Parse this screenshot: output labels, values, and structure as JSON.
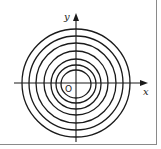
{
  "diagram": {
    "type": "contour-plot",
    "axes": {
      "x_label": "x",
      "y_label": "y",
      "origin_label": "O"
    },
    "center": [
      76,
      83
    ],
    "contours": [
      {
        "rx": 15,
        "ry": 14,
        "cy_offset": 1
      },
      {
        "rx": 20,
        "ry": 19,
        "cy_offset": 1
      },
      {
        "rx": 25,
        "ry": 25,
        "cy_offset": 1
      },
      {
        "rx": 32,
        "ry": 32,
        "cy_offset": 0
      },
      {
        "rx": 40,
        "ry": 40,
        "cy_offset": 0
      },
      {
        "rx": 47,
        "ry": 47,
        "cy_offset": 0
      },
      {
        "rx": 54,
        "ry": 54,
        "cy_offset": 0
      }
    ],
    "colors": {
      "stroke": "#1a1a1a",
      "frame": "#8a8a8a",
      "background": "#ffffff"
    }
  }
}
